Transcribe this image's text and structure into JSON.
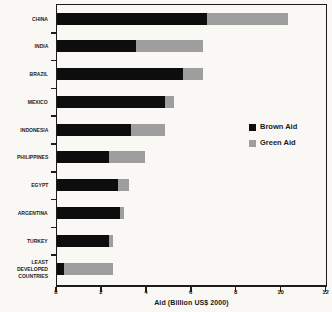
{
  "colors": {
    "ink": "#1c1c1c",
    "background": "#f9f8f5",
    "brown_aid": "#0d0d0d",
    "green_aid": "#9e9e9e"
  },
  "chart_data": {
    "type": "bar",
    "orientation": "horizontal",
    "stacked": true,
    "categories": [
      "CHINA",
      "INDIA",
      "BRAZIL",
      "MEXICO",
      "INDONESIA",
      "PHILIPPINES",
      "EGYPT",
      "ARGENTINA",
      "TURKEY",
      "LEAST DEVELOPED COUNTRIES"
    ],
    "series": [
      {
        "name": "Brown Aid",
        "color": "#0d0d0d",
        "values": [
          6.7,
          3.5,
          5.6,
          4.8,
          3.3,
          2.3,
          2.7,
          2.8,
          2.3,
          0.3
        ]
      },
      {
        "name": "Green Aid",
        "color": "#9e9e9e",
        "values": [
          3.6,
          3.0,
          0.9,
          0.4,
          1.5,
          1.6,
          0.5,
          0.2,
          0.2,
          2.2
        ]
      }
    ],
    "totals": [
      10.3,
      6.5,
      6.5,
      5.2,
      4.8,
      3.9,
      3.2,
      3.0,
      2.5,
      2.5
    ],
    "xlabel": "Aid (Billion US$ 2000)",
    "xlim": [
      0,
      12
    ],
    "xticks": [
      0,
      2,
      4,
      6,
      8,
      10,
      12
    ],
    "grid": false,
    "legend_position": "right-middle"
  }
}
